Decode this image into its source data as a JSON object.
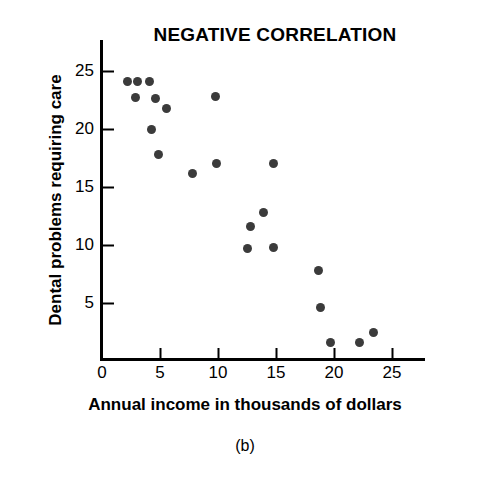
{
  "figure": {
    "caption": "(b)"
  },
  "chart_data": {
    "type": "scatter",
    "title": "NEGATIVE CORRELATION",
    "xlabel": "Annual income in thousands of dollars",
    "ylabel": "Dental problems requiring care",
    "xlim": [
      0,
      28
    ],
    "ylim": [
      0,
      27
    ],
    "xticks": [
      0,
      5,
      10,
      15,
      20,
      25
    ],
    "yticks": [
      5,
      10,
      15,
      20,
      25
    ],
    "xtick_labels": [
      "0",
      "5",
      "10",
      "15",
      "20",
      "25"
    ],
    "ytick_labels": [
      "5",
      "10",
      "15",
      "20",
      "25"
    ],
    "grid": false,
    "legend": false,
    "marker_color": "#3b3b3b",
    "axis_color": "#000000",
    "background_color": "#ffffff",
    "points": [
      {
        "x": 2.2,
        "y": 24.1
      },
      {
        "x": 3.1,
        "y": 24.1
      },
      {
        "x": 4.1,
        "y": 24.1
      },
      {
        "x": 2.9,
        "y": 22.7
      },
      {
        "x": 4.6,
        "y": 22.6
      },
      {
        "x": 5.6,
        "y": 21.8
      },
      {
        "x": 4.3,
        "y": 20.0
      },
      {
        "x": 4.9,
        "y": 17.8
      },
      {
        "x": 9.8,
        "y": 22.8
      },
      {
        "x": 7.8,
        "y": 16.2
      },
      {
        "x": 9.9,
        "y": 17.0
      },
      {
        "x": 14.8,
        "y": 17.0
      },
      {
        "x": 13.9,
        "y": 12.8
      },
      {
        "x": 12.8,
        "y": 11.6
      },
      {
        "x": 12.5,
        "y": 9.7
      },
      {
        "x": 14.8,
        "y": 9.8
      },
      {
        "x": 18.7,
        "y": 7.8
      },
      {
        "x": 18.8,
        "y": 4.6
      },
      {
        "x": 19.7,
        "y": 1.6
      },
      {
        "x": 22.2,
        "y": 1.6
      },
      {
        "x": 23.4,
        "y": 2.5
      }
    ]
  }
}
